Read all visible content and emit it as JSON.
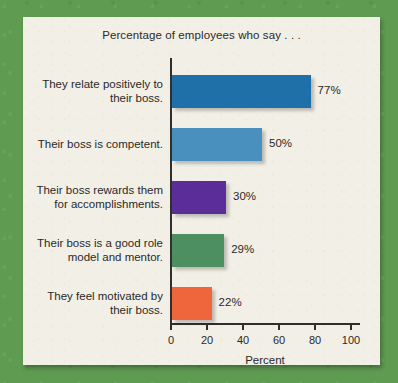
{
  "colors": {
    "mat": "#5f9b51",
    "panel": "#f2efe6",
    "axis": "#2f2f2d",
    "text": "#2a2a28"
  },
  "chart_data": {
    "type": "bar",
    "orientation": "horizontal",
    "title": "Percentage of employees who say . . .",
    "xlabel": "Percent",
    "ylabel": "",
    "xlim": [
      0,
      100
    ],
    "xticks": [
      0,
      20,
      40,
      60,
      80,
      100
    ],
    "xtick_labels": [
      "0",
      "20",
      "40",
      "60",
      "80",
      "100"
    ],
    "grid": false,
    "legend": "none",
    "categories": [
      "They relate positively to their boss.",
      "Their boss is competent.",
      "Their boss rewards them for accomplishments.",
      "Their boss is a good role model and mentor.",
      "They feel motivated by their boss."
    ],
    "values": [
      77,
      50,
      30,
      29,
      22
    ],
    "data_labels": [
      "77%",
      "50%",
      "30%",
      "29%",
      "22%"
    ],
    "bar_colors": [
      "#1f6fa8",
      "#4a90bf",
      "#5b2d99",
      "#4e8f62",
      "#f0663c"
    ],
    "bars": [
      {
        "label_line1": "They relate positively to",
        "label_line2": "their boss.",
        "value": 77,
        "data_label": "77%",
        "color": "#1f6fa8"
      },
      {
        "label_line1": "Their boss is competent.",
        "label_line2": "",
        "value": 50,
        "data_label": "50%",
        "color": "#4a90bf"
      },
      {
        "label_line1": "Their boss rewards them",
        "label_line2": "for accomplishments.",
        "value": 30,
        "data_label": "30%",
        "color": "#5b2d99"
      },
      {
        "label_line1": "Their boss is a good role",
        "label_line2": "model and mentor.",
        "value": 29,
        "data_label": "29%",
        "color": "#4e8f62"
      },
      {
        "label_line1": "They feel motivated by",
        "label_line2": "their boss.",
        "value": 22,
        "data_label": "22%",
        "color": "#f0663c"
      }
    ]
  }
}
